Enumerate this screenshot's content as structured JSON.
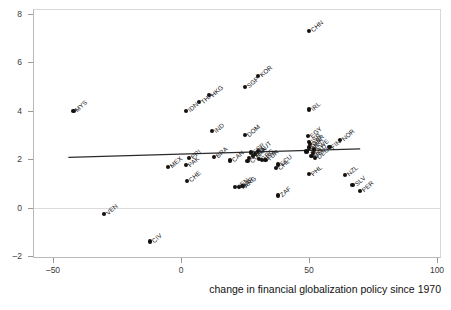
{
  "chart_data": {
    "type": "scatter",
    "title": "",
    "xlabel": "change in financial globalization policy since 1970",
    "ylabel": "",
    "xlim": [
      -50,
      100
    ],
    "ylim": [
      -2,
      8
    ],
    "xticks": [
      -50,
      0,
      50,
      100
    ],
    "yticks": [
      -2,
      0,
      2,
      4,
      6,
      8
    ],
    "xtick_labels": [
      "–50",
      "0",
      "50",
      "100"
    ],
    "ytick_labels": [
      "–2",
      "0",
      "2",
      "4",
      "6",
      "8"
    ],
    "grid": false,
    "legend": "none",
    "zero_reference_line": 0,
    "fit_line": {
      "type": "linear",
      "x_start": -44,
      "y_start": 2.08,
      "x_end": 70,
      "y_end": 2.43
    },
    "points": [
      {
        "label": "CHN",
        "x": 50.0,
        "y": 7.3
      },
      {
        "label": "KOR",
        "x": 30.0,
        "y": 5.45
      },
      {
        "label": "SGP",
        "x": 25.0,
        "y": 5.0
      },
      {
        "label": "HKG",
        "x": 11.0,
        "y": 4.65
      },
      {
        "label": "THA",
        "x": 7.0,
        "y": 4.35
      },
      {
        "label": "IRL",
        "x": 50.0,
        "y": 4.05
      },
      {
        "label": "IDN",
        "x": 2.0,
        "y": 4.0
      },
      {
        "label": "MYS",
        "x": -42.0,
        "y": 4.0
      },
      {
        "label": "IND",
        "x": 12.0,
        "y": 3.15
      },
      {
        "label": "DOM",
        "x": 25.0,
        "y": 3.0
      },
      {
        "label": "EGY",
        "x": 49.5,
        "y": 2.95
      },
      {
        "label": "NOR",
        "x": 62.0,
        "y": 2.8
      },
      {
        "label": "ISR",
        "x": 50.0,
        "y": 2.72
      },
      {
        "label": "GBR",
        "x": 50.5,
        "y": 2.62
      },
      {
        "label": "FIN",
        "x": 58.0,
        "y": 2.5
      },
      {
        "label": "DNK",
        "x": 50.0,
        "y": 2.48
      },
      {
        "label": "SWE",
        "x": 52.0,
        "y": 2.4
      },
      {
        "label": "AUT",
        "x": 30.0,
        "y": 2.35
      },
      {
        "label": "JPN",
        "x": 49.0,
        "y": 2.32
      },
      {
        "label": "NLD",
        "x": 51.5,
        "y": 2.25
      },
      {
        "label": "ESP",
        "x": 27.5,
        "y": 2.28
      },
      {
        "label": "ITA",
        "x": 29.0,
        "y": 2.2
      },
      {
        "label": "FRA",
        "x": 28.0,
        "y": 2.12
      },
      {
        "label": "BEL",
        "x": 51.0,
        "y": 2.12
      },
      {
        "label": "DEU",
        "x": 52.5,
        "y": 2.05
      },
      {
        "label": "PRT",
        "x": 26.5,
        "y": 2.05
      },
      {
        "label": "GRC",
        "x": 30.5,
        "y": 2.0
      },
      {
        "label": "USA",
        "x": 31.5,
        "y": 1.98
      },
      {
        "label": "BRA",
        "x": 13.0,
        "y": 2.1
      },
      {
        "label": "PRI",
        "x": 3.0,
        "y": 2.05
      },
      {
        "label": "CAN",
        "x": 19.0,
        "y": 1.95
      },
      {
        "label": "COL",
        "x": 26.0,
        "y": 1.92
      },
      {
        "label": "TUR",
        "x": 33.0,
        "y": 1.98
      },
      {
        "label": "ECU",
        "x": 38.0,
        "y": 1.78
      },
      {
        "label": "PAK",
        "x": 2.0,
        "y": 1.75
      },
      {
        "label": "MEX",
        "x": -5.0,
        "y": 1.68
      },
      {
        "label": "CHL",
        "x": 37.0,
        "y": 1.62
      },
      {
        "label": "PHL",
        "x": 50.0,
        "y": 1.38
      },
      {
        "label": "NZL",
        "x": 64.0,
        "y": 1.35
      },
      {
        "label": "CHE",
        "x": 2.5,
        "y": 1.1
      },
      {
        "label": "SLV",
        "x": 67.0,
        "y": 0.95
      },
      {
        "label": "ARG",
        "x": 24.0,
        "y": 0.88
      },
      {
        "label": "MAR",
        "x": 22.5,
        "y": 0.85
      },
      {
        "label": "KEN",
        "x": 21.0,
        "y": 0.85
      },
      {
        "label": "PER",
        "x": 70.0,
        "y": 0.7
      },
      {
        "label": "ZAF",
        "x": 38.0,
        "y": 0.5
      },
      {
        "label": "VEN",
        "x": -30.0,
        "y": -0.25
      },
      {
        "label": "CIV",
        "x": -12.0,
        "y": -1.4
      }
    ]
  },
  "axis": {
    "x_title": "change in financial globalization policy since 1970"
  }
}
